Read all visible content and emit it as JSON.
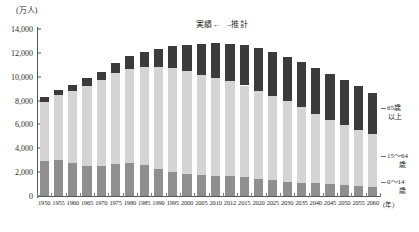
{
  "axes": {
    "y_unit_label": "(万人)",
    "y_ticks": [
      "14,000",
      "12,000",
      "10,000",
      "8,000",
      "6,000",
      "4,000",
      "2,000",
      "0"
    ],
    "x_unit_label": "(年)"
  },
  "phase_legend": {
    "actual": "実績",
    "arrow_left": "←",
    "arrow_right": "→",
    "estimate": "推計",
    "full": "実績←　→推計"
  },
  "callouts": {
    "old_line1": "65歳",
    "old_line2": "以上",
    "work_line1": "15～64",
    "work_line2": "歳",
    "young_line1": "0～14",
    "young_line2": "歳"
  },
  "chart_data": {
    "type": "bar",
    "title": "",
    "subtitle": "",
    "xlabel": "(年)",
    "ylabel": "(万人)",
    "ylim": [
      0,
      14000
    ],
    "grid": false,
    "stacked": true,
    "legend_position": "right-outside",
    "categories": [
      "1950",
      "1955",
      "1960",
      "1965",
      "1970",
      "1975",
      "1980",
      "1985",
      "1990",
      "1995",
      "2000",
      "2005",
      "2010",
      "2012",
      "2015",
      "2020",
      "2025",
      "2030",
      "2035",
      "2040",
      "2045",
      "2050",
      "2055",
      "2060"
    ],
    "series": [
      {
        "name": "0～14歳",
        "color": "#8f8f8f",
        "values": [
          2943,
          2980,
          2807,
          2553,
          2482,
          2722,
          2751,
          2603,
          2249,
          2001,
          1847,
          1752,
          1684,
          1655,
          1583,
          1457,
          1324,
          1204,
          1129,
          1073,
          1012,
          939,
          861,
          791
        ]
      },
      {
        "name": "15～64歳",
        "color": "#d4d4d4",
        "values": [
          4966,
          5473,
          6000,
          6693,
          7212,
          7581,
          7883,
          8251,
          8590,
          8716,
          8622,
          8409,
          8173,
          8018,
          7682,
          7341,
          7085,
          6773,
          6343,
          5787,
          5353,
          5001,
          4706,
          4418
        ]
      },
      {
        "name": "65歳以上",
        "color": "#3b3b3b",
        "values": [
          411,
          475,
          540,
          618,
          733,
          887,
          1065,
          1247,
          1493,
          1828,
          2204,
          2576,
          2948,
          3079,
          3395,
          3612,
          3657,
          3685,
          3741,
          3868,
          3856,
          3768,
          3626,
          3464
        ]
      }
    ],
    "totals": [
      8320,
      8928,
      9347,
      9864,
      10427,
      11190,
      11699,
      12101,
      12332,
      12545,
      12673,
      12737,
      12805,
      12752,
      12660,
      12410,
      12066,
      11662,
      11213,
      10728,
      10221,
      9708,
      9193,
      8673
    ],
    "actual_period": "1950-2010",
    "estimate_period": "2012-2060"
  }
}
